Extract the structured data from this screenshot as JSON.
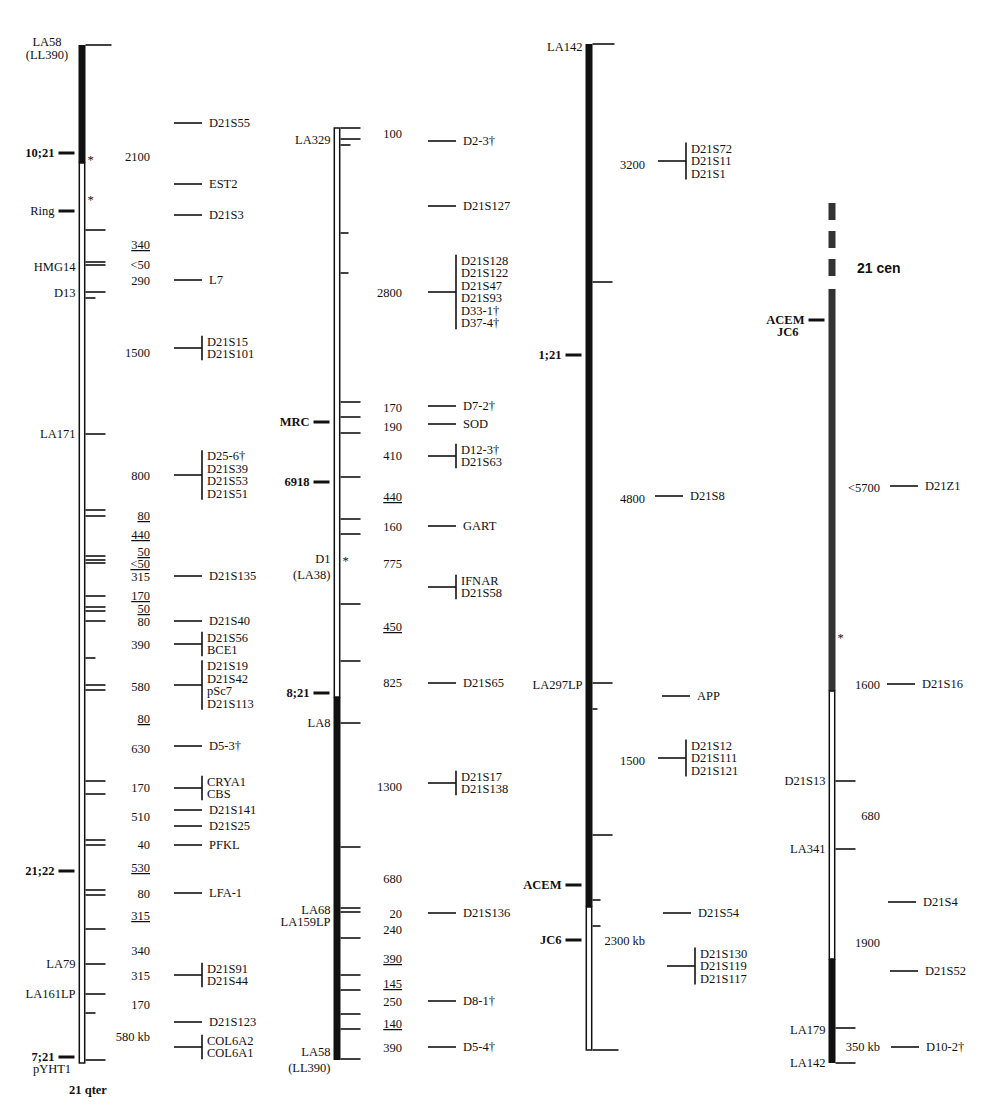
{
  "colors": {
    "ink": "#111111",
    "paper": "#ffffff",
    "centromere": "#333333"
  },
  "panels": [
    {
      "id": "panel1",
      "bar": {
        "x": 82,
        "top": 45,
        "bottom": 1063,
        "segments": [
          {
            "from": 45,
            "to": 163,
            "style": "solid"
          },
          {
            "from": 163,
            "to": 1063,
            "style": "hollow"
          }
        ]
      },
      "top_label": [
        "LA58",
        "(LL390)"
      ],
      "bottom_label": [
        "pYHT1"
      ],
      "footer": "21 qter",
      "ticks_right": [
        45,
        230,
        262,
        265,
        292,
        298,
        434,
        510,
        516,
        556,
        560,
        563,
        596,
        607,
        611,
        621,
        658,
        685,
        690,
        781,
        794,
        840,
        845,
        890,
        895,
        929,
        964,
        994,
        1013,
        1060
      ],
      "tick_lengths": {
        "45": 26,
        "658": 10,
        "1013": 10,
        "298": 10
      },
      "left_markers": [
        {
          "y": 153,
          "label": "10;21",
          "bold": true,
          "bar": true
        },
        {
          "y": 211,
          "label": "Ring",
          "bold": false,
          "bar": true
        },
        {
          "y": 871,
          "label": "21;22",
          "bold": true,
          "bar": true
        },
        {
          "y": 1057,
          "label": "7;21",
          "bold": true,
          "bar": true
        }
      ],
      "left_labels": [
        {
          "y": 267,
          "label": "HMG14"
        },
        {
          "y": 293,
          "label": "D13"
        },
        {
          "y": 434,
          "label": "LA171"
        },
        {
          "y": 964,
          "label": "LA79"
        },
        {
          "y": 994,
          "label": "LA161LP"
        }
      ],
      "stars": [
        160,
        200
      ],
      "distances": [
        {
          "y": 157,
          "text": "2100"
        },
        {
          "y": 245,
          "text": "340",
          "underline": true
        },
        {
          "y": 265,
          "text": "<50"
        },
        {
          "y": 281,
          "text": "290"
        },
        {
          "y": 353,
          "text": "1500"
        },
        {
          "y": 476,
          "text": "800"
        },
        {
          "y": 516,
          "text": "80",
          "underline": true
        },
        {
          "y": 535,
          "text": "440",
          "underline": true
        },
        {
          "y": 552,
          "text": "50",
          "underline": true
        },
        {
          "y": 564,
          "text": "<50",
          "underline": true
        },
        {
          "y": 577,
          "text": "315"
        },
        {
          "y": 596,
          "text": "170",
          "underline": true
        },
        {
          "y": 609,
          "text": "50",
          "underline": true
        },
        {
          "y": 622,
          "text": "80"
        },
        {
          "y": 645,
          "text": "390"
        },
        {
          "y": 687,
          "text": "580"
        },
        {
          "y": 719,
          "text": "80",
          "underline": true
        },
        {
          "y": 749,
          "text": "630"
        },
        {
          "y": 788,
          "text": "170"
        },
        {
          "y": 817,
          "text": "510"
        },
        {
          "y": 845,
          "text": "40"
        },
        {
          "y": 868,
          "text": "530",
          "underline": true
        },
        {
          "y": 894,
          "text": "80"
        },
        {
          "y": 916,
          "text": "315",
          "underline": true
        },
        {
          "y": 951,
          "text": "340"
        },
        {
          "y": 976,
          "text": "315"
        },
        {
          "y": 1005,
          "text": "170"
        },
        {
          "y": 1037,
          "text": "580 kb"
        }
      ],
      "markers": [
        {
          "y": 123,
          "names": [
            "D21S55"
          ]
        },
        {
          "y": 184,
          "names": [
            "EST2"
          ]
        },
        {
          "y": 215,
          "names": [
            "D21S3"
          ]
        },
        {
          "y": 280,
          "names": [
            "L7"
          ]
        },
        {
          "y": 348,
          "names": [
            "D21S15",
            "D21S101"
          ]
        },
        {
          "y": 475,
          "names": [
            "D25-6†",
            "D21S39",
            "D21S53",
            "D21S51"
          ]
        },
        {
          "y": 576,
          "names": [
            "D21S135"
          ]
        },
        {
          "y": 621,
          "names": [
            "D21S40"
          ]
        },
        {
          "y": 644,
          "names": [
            "D21S56",
            "BCE1"
          ]
        },
        {
          "y": 685,
          "names": [
            "D21S19",
            "D21S42",
            "pSc7",
            "D21S113"
          ]
        },
        {
          "y": 746,
          "names": [
            "D5-3†"
          ]
        },
        {
          "y": 788,
          "names": [
            "CRYA1",
            "CBS"
          ]
        },
        {
          "y": 810,
          "names": [
            "D21S141"
          ]
        },
        {
          "y": 826,
          "names": [
            "D21S25"
          ]
        },
        {
          "y": 845,
          "names": [
            "PFKL"
          ]
        },
        {
          "y": 893,
          "names": [
            "LFA-1"
          ]
        },
        {
          "y": 975,
          "names": [
            "D21S91",
            "D21S44"
          ]
        },
        {
          "y": 1022,
          "names": [
            "D21S123"
          ]
        },
        {
          "y": 1047,
          "names": [
            "COL6A2",
            "COL6A1"
          ]
        }
      ]
    },
    {
      "id": "panel2",
      "bar": {
        "x": 337,
        "top": 128,
        "bottom": 1060,
        "segments": [
          {
            "from": 128,
            "to": 697,
            "style": "hollow"
          },
          {
            "from": 697,
            "to": 1060,
            "style": "solid"
          }
        ]
      },
      "top_label": [
        "LA329"
      ],
      "bottom_label": [
        "LA58",
        "(LL390)"
      ],
      "ticks_right": [
        128,
        139,
        145,
        233,
        273,
        402,
        417,
        433,
        477,
        519,
        534,
        604,
        661,
        723,
        847,
        908,
        912,
        938,
        975,
        990,
        1014,
        1029,
        1059
      ],
      "tick_lengths": {
        "145": 10,
        "233": 8,
        "273": 8
      },
      "left_markers": [
        {
          "y": 422,
          "label": "MRC",
          "bold": true,
          "bar": true
        },
        {
          "y": 482,
          "label": "6918",
          "bold": true,
          "bar": true
        },
        {
          "y": 693,
          "label": "8;21",
          "bold": true,
          "bar": true
        }
      ],
      "left_labels": [
        {
          "y": 140,
          "label": "LA329",
          "side": "top"
        },
        {
          "y": 559,
          "label": "D1"
        },
        {
          "y": 575,
          "label": "(LA38)"
        },
        {
          "y": 723,
          "label": "LA8"
        },
        {
          "y": 910,
          "label": "LA68"
        },
        {
          "y": 922,
          "label": "LA159LP"
        },
        {
          "y": 1052,
          "label": "LA58"
        },
        {
          "y": 1068,
          "label": "(LL390)"
        }
      ],
      "stars": [
        561
      ],
      "distances": [
        {
          "y": 134,
          "text": "100"
        },
        {
          "y": 293,
          "text": "2800"
        },
        {
          "y": 408,
          "text": "170"
        },
        {
          "y": 427,
          "text": "190"
        },
        {
          "y": 456,
          "text": "410"
        },
        {
          "y": 497,
          "text": "440",
          "underline": true
        },
        {
          "y": 527,
          "text": "160"
        },
        {
          "y": 564,
          "text": "775"
        },
        {
          "y": 627,
          "text": "450",
          "underline": true
        },
        {
          "y": 683,
          "text": "825"
        },
        {
          "y": 787,
          "text": "1300"
        },
        {
          "y": 879,
          "text": "680"
        },
        {
          "y": 914,
          "text": "20"
        },
        {
          "y": 930,
          "text": "240"
        },
        {
          "y": 959,
          "text": "390",
          "underline": true
        },
        {
          "y": 984,
          "text": "145",
          "underline": true
        },
        {
          "y": 1002,
          "text": "250"
        },
        {
          "y": 1024,
          "text": "140",
          "underline": true
        },
        {
          "y": 1048,
          "text": "390"
        }
      ],
      "markers": [
        {
          "y": 141,
          "names": [
            "D2-3†"
          ]
        },
        {
          "y": 206,
          "names": [
            "D21S127"
          ]
        },
        {
          "y": 292,
          "names": [
            "D21S128",
            "D21S122",
            "D21S47",
            "D21S93",
            "D33-1†",
            "D37-4†"
          ]
        },
        {
          "y": 406,
          "names": [
            "D7-2†"
          ]
        },
        {
          "y": 424,
          "names": [
            "SOD"
          ]
        },
        {
          "y": 456,
          "names": [
            "D12-3†",
            "D21S63"
          ]
        },
        {
          "y": 526,
          "names": [
            "GART"
          ]
        },
        {
          "y": 587,
          "names": [
            "IFNAR",
            "D21S58"
          ]
        },
        {
          "y": 683,
          "names": [
            "D21S65"
          ]
        },
        {
          "y": 783,
          "names": [
            "D21S17",
            "D21S138"
          ]
        },
        {
          "y": 913,
          "names": [
            "D21S136"
          ]
        },
        {
          "y": 1001,
          "names": [
            "D8-1†"
          ]
        },
        {
          "y": 1047,
          "names": [
            "D5-4†"
          ]
        }
      ]
    },
    {
      "id": "panel3",
      "bar": {
        "x": 589,
        "top": 44,
        "bottom": 1050,
        "segments": [
          {
            "from": 44,
            "to": 907,
            "style": "solid"
          },
          {
            "from": 907,
            "to": 1050,
            "style": "hollow"
          }
        ]
      },
      "top_label": [
        "LA142"
      ],
      "bottom_label": [],
      "ticks_right": [
        44,
        282,
        683,
        709,
        835,
        900,
        926,
        1050
      ],
      "tick_lengths": {
        "709": 5,
        "900": 8,
        "926": 8,
        "44": 22,
        "1050": 26
      },
      "left_markers": [
        {
          "y": 355,
          "label": "1;21",
          "bold": true,
          "bar": true
        },
        {
          "y": 885,
          "label": "ACEM",
          "bold": true,
          "bar": true
        },
        {
          "y": 940,
          "label": "JC6",
          "bold": true,
          "bar": true
        }
      ],
      "left_labels": [
        {
          "y": 47,
          "label": "LA142"
        },
        {
          "y": 685,
          "label": "LA297LP"
        }
      ],
      "stars": [],
      "distances": [
        {
          "y": 165,
          "text": "3200"
        },
        {
          "y": 499,
          "text": "4800"
        },
        {
          "y": 761,
          "text": "1500"
        },
        {
          "y": 941,
          "text": "2300 kb"
        }
      ],
      "markers": [
        {
          "y": 161,
          "names": [
            "D21S72",
            "D21S11",
            "D21S1"
          ],
          "x": 658
        },
        {
          "y": 496,
          "names": [
            "D21S8"
          ],
          "x": 655
        },
        {
          "y": 696,
          "names": [
            "APP"
          ],
          "x": 662
        },
        {
          "y": 758,
          "names": [
            "D21S12",
            "D21S111",
            "D21S121"
          ],
          "x": 658
        },
        {
          "y": 913,
          "names": [
            "D21S54"
          ],
          "x": 663
        },
        {
          "y": 966,
          "names": [
            "D21S130",
            "D21S119",
            "D21S117"
          ],
          "x": 667
        }
      ]
    },
    {
      "id": "panel4",
      "bar": {
        "x": 832,
        "top": 203,
        "bottom": 1063,
        "segments": [
          {
            "from": 203,
            "to": 220,
            "style": "hatched"
          },
          {
            "from": 231,
            "to": 248,
            "style": "hatched"
          },
          {
            "from": 259,
            "to": 276,
            "style": "hatched"
          },
          {
            "from": 289,
            "to": 691,
            "style": "hatched"
          },
          {
            "from": 691,
            "to": 959,
            "style": "hollow"
          },
          {
            "from": 959,
            "to": 1063,
            "style": "solid"
          }
        ]
      },
      "centromere_label": "21   cen",
      "top_label": [],
      "bottom_label": [],
      "ticks_right": [
        781,
        849,
        1028,
        1063
      ],
      "tick_lengths": {},
      "left_markers": [
        {
          "y": 320,
          "label": "ACEM",
          "bold": true,
          "bar": true,
          "second": "JC6"
        }
      ],
      "left_labels": [
        {
          "y": 781,
          "label": "D21S13"
        },
        {
          "y": 849,
          "label": "LA341"
        },
        {
          "y": 1030,
          "label": "LA179"
        },
        {
          "y": 1063,
          "label": "LA142"
        }
      ],
      "stars": [
        638
      ],
      "distances": [
        {
          "y": 488,
          "text": "<5700"
        },
        {
          "y": 685,
          "text": "1600"
        },
        {
          "y": 816,
          "text": "680"
        },
        {
          "y": 943,
          "text": "1900"
        },
        {
          "y": 1047,
          "text": "350 kb"
        }
      ],
      "markers": [
        {
          "y": 486,
          "names": [
            "D21Z1"
          ],
          "x": 890
        },
        {
          "y": 684,
          "names": [
            "D21S16"
          ],
          "x": 887
        },
        {
          "y": 902,
          "names": [
            "D21S4"
          ],
          "x": 888
        },
        {
          "y": 971,
          "names": [
            "D21S52"
          ],
          "x": 890
        },
        {
          "y": 1047,
          "names": [
            "D10-2†"
          ],
          "x": 891
        }
      ]
    }
  ]
}
